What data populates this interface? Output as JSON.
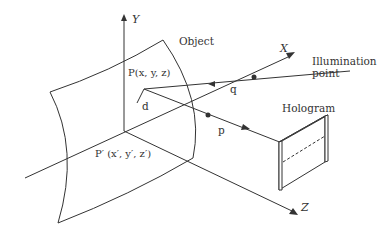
{
  "diagram": {
    "axes": {
      "y_label": "Y",
      "x_label": "X",
      "z_label": "Z"
    },
    "labels": {
      "object": "Object",
      "point_p": "P(x, y, z)",
      "point_p_prime": "P′ (x′, y′, z′)",
      "illumination_line1": "Illumination",
      "illumination_line2": "point",
      "hologram": "Hologram",
      "q": "q",
      "d": "d",
      "p": "p"
    },
    "colors": {
      "stroke": "#333333",
      "background": "#ffffff"
    }
  }
}
